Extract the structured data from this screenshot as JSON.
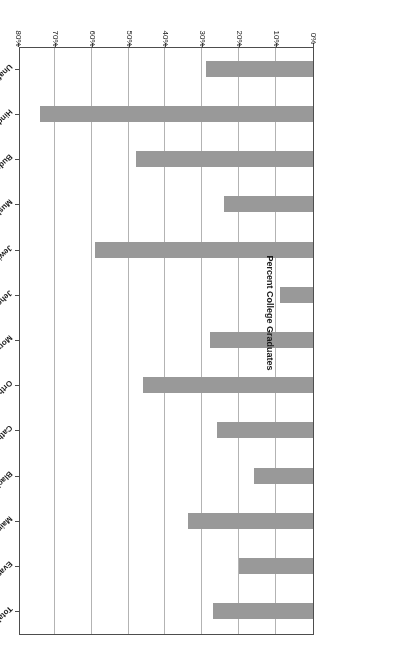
{
  "chart_data": {
    "type": "bar",
    "orientation": "horizontal",
    "title": "",
    "subtitle": "",
    "xlabel": "Percent College Graduates",
    "ylabel": "",
    "xlim": [
      0,
      80
    ],
    "xtick_labels": [
      "0%",
      "10%",
      "20%",
      "30%",
      "40%",
      "50%",
      "60%",
      "70%",
      "80%"
    ],
    "xtick_values": [
      0,
      10,
      20,
      30,
      40,
      50,
      60,
      70,
      80
    ],
    "grid": "vertical",
    "legend": "none",
    "bar_color": "#999999",
    "rotation_note": "figure rendered rotated 180 degrees",
    "categories": [
      "Total Population",
      "Evangelicals",
      "Mainline",
      "Black Protestants",
      "Catholic",
      "Orthodox",
      "Mormons",
      "Jehovah's Witnesses",
      "Jewish",
      "Muslim",
      "Buddhist",
      "Hindu",
      "Unaffiliated"
    ],
    "values": [
      27,
      20,
      34,
      16,
      26,
      46,
      28,
      9,
      59,
      24,
      48,
      74,
      29
    ],
    "series": [
      {
        "name": "Percent College Graduates",
        "values": [
          27,
          20,
          34,
          16,
          26,
          46,
          28,
          9,
          59,
          24,
          48,
          74,
          29
        ]
      }
    ]
  }
}
